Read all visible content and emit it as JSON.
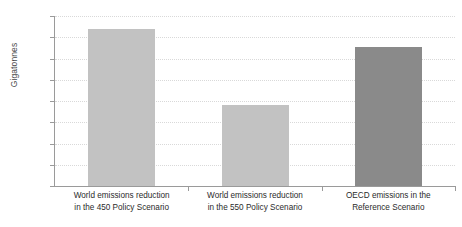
{
  "chart_data": {
    "type": "bar",
    "title": "",
    "subtitle": "",
    "xlabel": "",
    "ylabel": "Gigatonnes",
    "ylim": [
      0,
      16
    ],
    "ytick_step": 2,
    "yticks": [
      "0",
      "2",
      "4",
      "6",
      "8",
      "10",
      "12",
      "14",
      "16"
    ],
    "grid": true,
    "grid_style": "dotted-horizontal",
    "legend": "none",
    "categories": [
      "World emissions reduction in the 450 Policy Scenario",
      "World emissions reduction in the 550 Policy Scenario",
      "OECD emissions in the Reference Scenario"
    ],
    "category_lines": [
      [
        "World emissions reduction",
        "in the 450 Policy Scenario"
      ],
      [
        "World emissions reduction",
        "in the 550 Policy Scenario"
      ],
      [
        "OECD emissions in the",
        "Reference Scenario"
      ]
    ],
    "values": [
      14.8,
      7.6,
      13.1
    ],
    "bar_colors": [
      "#c2c2c2",
      "#c2c2c2",
      "#8a8a8a"
    ]
  },
  "colors": {
    "background": "#ffffff",
    "axis": "#9a9a9a",
    "grid": "#d9d9d9",
    "tick_text": "#4a4a4a",
    "category_text": "#2b2b2b",
    "bar_light": "#c2c2c2",
    "bar_dark": "#8a8a8a"
  }
}
